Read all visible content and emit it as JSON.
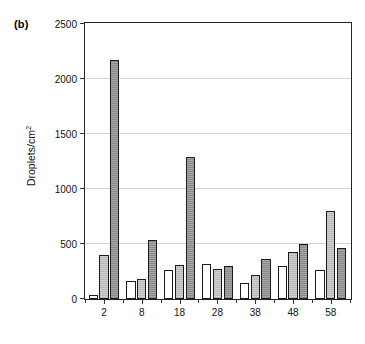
{
  "panel": {
    "label": "(b)"
  },
  "chart_data": {
    "type": "bar",
    "title": "",
    "subtitle": "",
    "xlabel": "",
    "ylabel": "Droplets/cm",
    "ylabel_sup": "2",
    "ylim": [
      0,
      2500
    ],
    "yticks": [
      0,
      500,
      1000,
      1500,
      2000,
      2500
    ],
    "ytick_labels": [
      "0",
      "500",
      "1000",
      "1500",
      "2000",
      "2500"
    ],
    "grid": "horizontal",
    "legend": "none",
    "categories": [
      "2",
      "8",
      "18",
      "28",
      "38",
      "48",
      "58"
    ],
    "series": [
      {
        "name": "series-1",
        "fill": "white",
        "values": [
          40,
          160,
          260,
          320,
          150,
          300,
          260
        ]
      },
      {
        "name": "series-2",
        "fill": "light-gray",
        "values": [
          400,
          185,
          310,
          270,
          215,
          430,
          800
        ]
      },
      {
        "name": "series-3",
        "fill": "dark-gray",
        "values": [
          2170,
          540,
          1290,
          300,
          365,
          500,
          460
        ]
      }
    ],
    "colors": {
      "axis": "#222222",
      "grid": "#d3d3d3",
      "series_1": "#ffffff",
      "series_2": "#c4c4c4",
      "series_3": "#999999"
    }
  }
}
